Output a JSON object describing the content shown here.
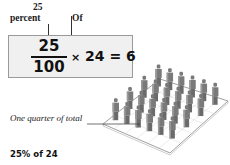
{
  "labels": {
    "numerator_label": "25",
    "percent_label": "percent",
    "of_label": "Of"
  },
  "equation": {
    "numerator": "25",
    "denominator": "100",
    "times_symbol": "×",
    "multiplier": "24",
    "equals": "=",
    "result": "6"
  },
  "illustration": {
    "annotation": "One quarter of total",
    "total_figures": 24,
    "grid_rows": 4,
    "grid_cols": 6,
    "figure_color": "#7a7a7a",
    "platform_color": "#ffffff",
    "platform_stroke": "#888888"
  },
  "caption": "25% of 24"
}
